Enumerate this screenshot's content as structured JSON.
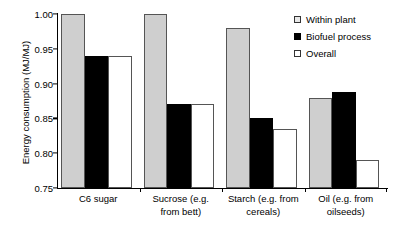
{
  "chart_data": {
    "type": "bar",
    "title": "",
    "xlabel": "",
    "ylabel": "Energy consumption (MJ/MJ)",
    "ylim": [
      0.75,
      1.0
    ],
    "ytick_labels": [
      "1.00",
      "0.95",
      "0.90",
      "0.85",
      "0.80",
      "0.75"
    ],
    "yticks": [
      1.0,
      0.95,
      0.9,
      0.85,
      0.8,
      0.75
    ],
    "grid": false,
    "legend_position": "top-right",
    "categories": [
      "C6 sugar",
      "Sucrose (e.g. from bett)",
      "Starch (e.g. from cereals)",
      "Oil (e.g. from oilseeds)"
    ],
    "category_lines": [
      [
        "C6 sugar"
      ],
      [
        "Sucrose (e.g.",
        "from bett)"
      ],
      [
        "Starch (e.g. from",
        "cereals)"
      ],
      [
        "Oil (e.g. from",
        "oilseeds)"
      ]
    ],
    "series": [
      {
        "name": "Within plant",
        "color": "#cfcfcf",
        "values": [
          1.0,
          1.0,
          0.98,
          0.88
        ]
      },
      {
        "name": "Biofuel process",
        "color": "#000000",
        "values": [
          0.94,
          0.87,
          0.85,
          0.888
        ]
      },
      {
        "name": "Overall",
        "color": "#ffffff",
        "values": [
          0.94,
          0.87,
          0.835,
          0.79
        ]
      }
    ]
  },
  "legend": {
    "items": [
      {
        "label": "Within plant",
        "swatch": "legend-swatch-gray"
      },
      {
        "label": "Biofuel process",
        "swatch": "legend-swatch-black"
      },
      {
        "label": "Overall",
        "swatch": "legend-swatch-white"
      }
    ]
  }
}
